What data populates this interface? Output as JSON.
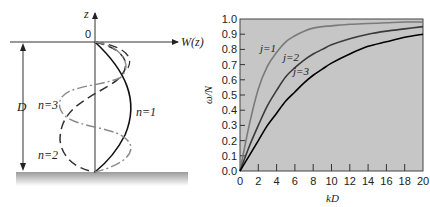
{
  "left_diagram": {
    "axis_z_label": "z",
    "axis_w_label": "W(z)",
    "origin_label": "0",
    "depth_label": "D",
    "modes": [
      {
        "label": "n=1",
        "style": "solid"
      },
      {
        "label": "n=2",
        "style": "dashed"
      },
      {
        "label": "n=3",
        "style": "dash-dot (gray)"
      }
    ]
  },
  "chart_data": {
    "type": "line",
    "title": "",
    "xlabel": "kD",
    "ylabel": "ω/N",
    "xlim": [
      0,
      20
    ],
    "ylim": [
      0,
      1.0
    ],
    "x_ticks": [
      "0",
      "2",
      "4",
      "6",
      "8",
      "10",
      "12",
      "14",
      "16",
      "18",
      "20"
    ],
    "y_ticks": [
      "0.0",
      "0.1",
      "0.2",
      "0.3",
      "0.4",
      "0.5",
      "0.6",
      "0.7",
      "0.8",
      "0.9",
      "1.0"
    ],
    "grid": false,
    "background": "#c8c8c8",
    "x": [
      0,
      1,
      2,
      3,
      4,
      5,
      6,
      7,
      8,
      9,
      10,
      12,
      14,
      16,
      18,
      20
    ],
    "series": [
      {
        "name": "j=1",
        "color": "#7a7a7a",
        "values": [
          0,
          0.3,
          0.54,
          0.69,
          0.78,
          0.85,
          0.89,
          0.92,
          0.94,
          0.95,
          0.955,
          0.965,
          0.97,
          0.975,
          0.98,
          0.98
        ]
      },
      {
        "name": "j=2",
        "color": "#3a3a3a",
        "values": [
          0,
          0.16,
          0.3,
          0.43,
          0.53,
          0.62,
          0.68,
          0.73,
          0.77,
          0.8,
          0.83,
          0.87,
          0.9,
          0.92,
          0.935,
          0.95
        ]
      },
      {
        "name": "j=3",
        "color": "#000000",
        "values": [
          0,
          0.1,
          0.2,
          0.3,
          0.38,
          0.46,
          0.52,
          0.58,
          0.63,
          0.67,
          0.71,
          0.77,
          0.82,
          0.85,
          0.88,
          0.9
        ]
      }
    ],
    "annotations": [
      "j=1",
      "j=2",
      "j=3"
    ]
  }
}
